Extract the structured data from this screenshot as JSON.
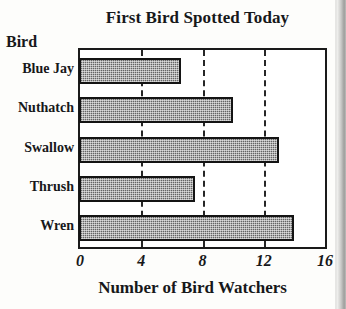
{
  "chart_data": {
    "type": "bar",
    "orientation": "horizontal",
    "title": "First Bird Spotted Today",
    "xlabel": "Number of Bird Watchers",
    "ylabel": "Bird",
    "categories": [
      "Blue Jay",
      "Nuthatch",
      "Swallow",
      "Thrush",
      "Wren"
    ],
    "values": [
      6.6,
      10,
      13,
      7.5,
      14
    ],
    "series": [
      {
        "name": "Number of Bird Watchers",
        "values": [
          6.6,
          10,
          13,
          7.5,
          14
        ]
      }
    ],
    "xlim": [
      0,
      16
    ],
    "xticks": [
      0,
      4,
      8,
      12,
      16
    ],
    "xtick_labels": [
      "0",
      "4",
      "8",
      "12",
      "16"
    ],
    "gridlines": [
      4,
      8,
      12
    ],
    "grid": true,
    "grid_style": "dashed-vertical",
    "legend": null,
    "bar_fill_color": "#8f8f8f",
    "bar_fill_pattern": "dither-checker",
    "bar_edge_color": "#141414",
    "frame_color": "#1a1a1a",
    "background_color": "#ffffff"
  }
}
